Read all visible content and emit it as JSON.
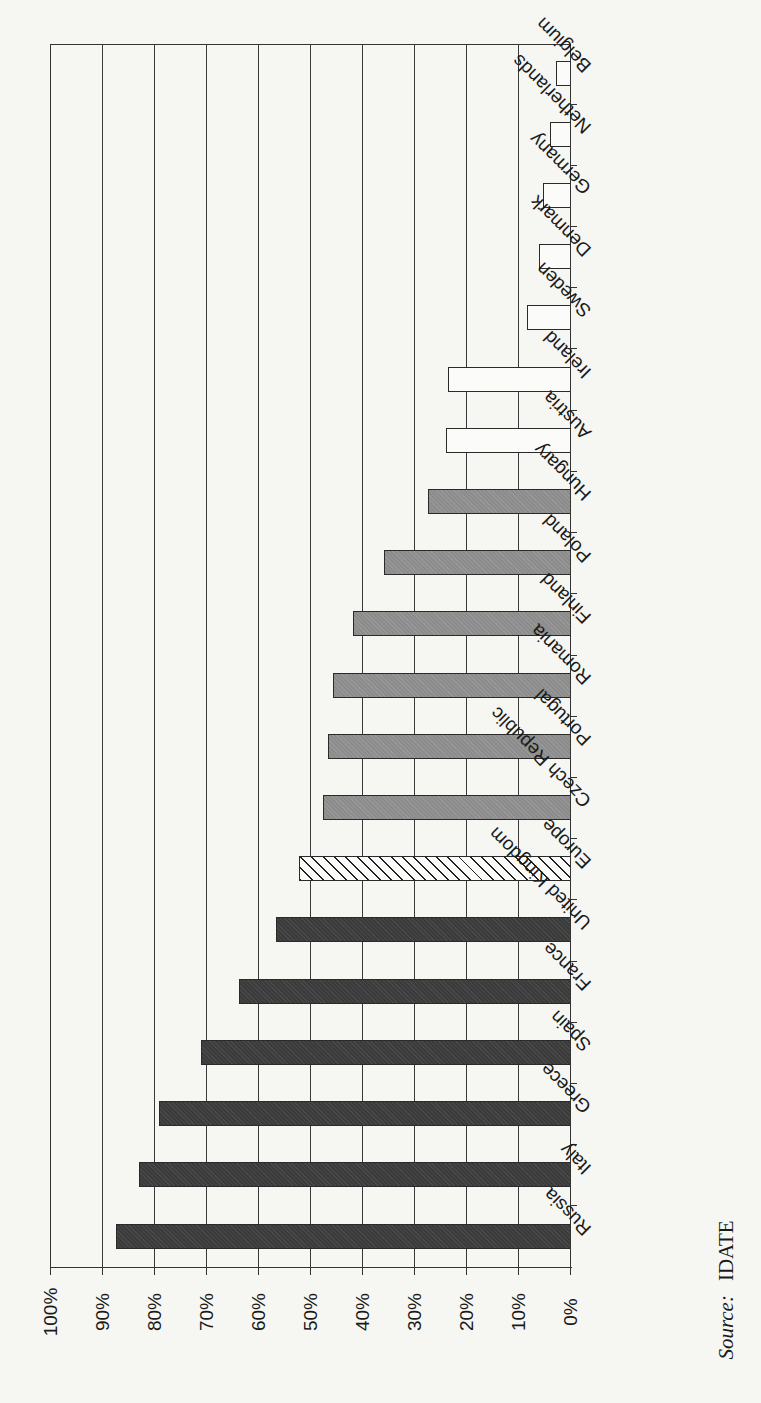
{
  "chart_data": {
    "type": "bar",
    "orientation": "horizontal",
    "title": "",
    "xlabel": "",
    "ylabel": "",
    "value_axis": {
      "range": [
        0,
        100
      ],
      "unit": "%",
      "ticks": [
        "0%",
        "10%",
        "20%",
        "30%",
        "40%",
        "50%",
        "60%",
        "70%",
        "80%",
        "90%",
        "100%"
      ]
    },
    "grid": true,
    "legend": null,
    "categories": [
      "Belgium",
      "Netherlands",
      "Germany",
      "Denmark",
      "Sweden",
      "Ireland",
      "Austria",
      "Hungary",
      "Poland",
      "Finland",
      "Romania",
      "Portugal",
      "Czech Republic",
      "Europe",
      "United Kingdom",
      "France",
      "Spain",
      "Greece",
      "Italy",
      "Russia"
    ],
    "values": [
      2.6,
      3.9,
      5.1,
      6.0,
      8.3,
      23.5,
      23.9,
      27.3,
      35.8,
      41.8,
      45.6,
      46.6,
      47.5,
      52.1,
      56.6,
      63.6,
      70.9,
      79.1,
      82.8,
      87.4
    ],
    "bar_styles": [
      "white",
      "white",
      "white",
      "white",
      "white",
      "white",
      "white",
      "grey",
      "grey",
      "grey",
      "grey",
      "grey",
      "grey",
      "hatched",
      "dark",
      "dark",
      "dark",
      "dark",
      "dark",
      "dark"
    ],
    "source": "IDATE"
  },
  "colors": {
    "background": "#f6f6f3",
    "grid": "#3a3a3a",
    "bar_white": "#fbfbf9",
    "bar_grey": "#8c8c8c",
    "bar_dark": "#3b3b3b"
  },
  "source_label": "Source:",
  "source_value": "IDATE"
}
